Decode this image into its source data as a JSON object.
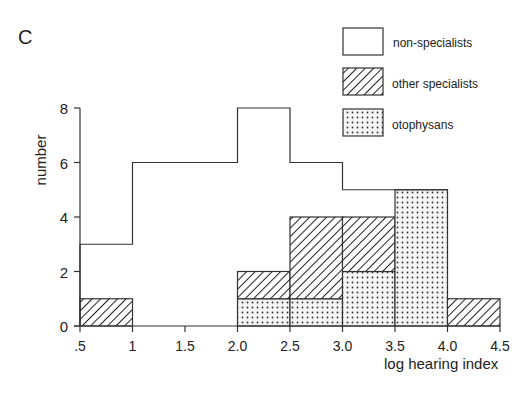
{
  "panel_label": "C",
  "chart_data": {
    "type": "bar",
    "subtype": "stacked-histogram",
    "title": "",
    "xlabel": "log hearing index",
    "ylabel": "number",
    "x_tick_labels": [
      ".5",
      "1",
      "1.5",
      "2.0",
      "2.5",
      "3.0",
      "3.5",
      "4.0",
      "4.5"
    ],
    "x_ticks": [
      0.5,
      1.0,
      1.5,
      2.0,
      2.5,
      3.0,
      3.5,
      4.0,
      4.5
    ],
    "y_tick_labels": [
      "0",
      "2",
      "4",
      "6",
      "8"
    ],
    "y_ticks": [
      0,
      2,
      4,
      6,
      8
    ],
    "xlim": [
      0.5,
      4.5
    ],
    "ylim": [
      0,
      8
    ],
    "grid": false,
    "legend_position": "top-right",
    "bins": [
      [
        0.5,
        1.0
      ],
      [
        1.0,
        1.5
      ],
      [
        1.5,
        2.0
      ],
      [
        2.0,
        2.5
      ],
      [
        2.5,
        3.0
      ],
      [
        3.0,
        3.5
      ],
      [
        3.5,
        4.0
      ],
      [
        4.0,
        4.5
      ]
    ],
    "series": [
      {
        "name": "non-specialists",
        "pattern": "open",
        "values": [
          3,
          6,
          6,
          8,
          6,
          5,
          5,
          0
        ]
      },
      {
        "name": "other specialists",
        "pattern": "hatched",
        "values": [
          1,
          0,
          0,
          1,
          3,
          2,
          0,
          1
        ]
      },
      {
        "name": "otophysans",
        "pattern": "dotted",
        "values": [
          0,
          0,
          0,
          1,
          1,
          2,
          5,
          0
        ]
      }
    ]
  },
  "legend": {
    "items": [
      {
        "label": "non-specialists",
        "pattern": "open"
      },
      {
        "label": "other specialists",
        "pattern": "hatched"
      },
      {
        "label": "otophysans",
        "pattern": "dotted"
      }
    ]
  }
}
